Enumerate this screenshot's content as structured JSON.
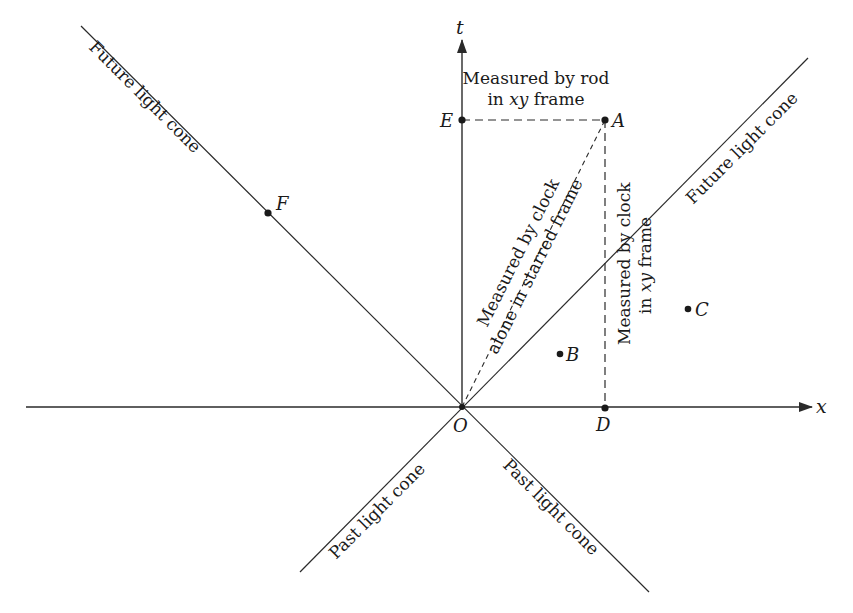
{
  "diagram": {
    "axes": {
      "x_label": "x",
      "t_label": "t",
      "origin_label": "O"
    },
    "light_cones": {
      "future_left": "Future light cone",
      "future_right": "Future light cone",
      "past_left": "Past light cone",
      "past_right": "Past light cone"
    },
    "points": {
      "A": "A",
      "B": "B",
      "C": "C",
      "D": "D",
      "E": "E",
      "F": "F"
    },
    "annotations": {
      "rod_line1": "Measured by rod",
      "rod_line2_pre": "in ",
      "rod_line2_it": "xy",
      "rod_line2_post": " frame",
      "starred_line1": "Measured by clock",
      "starred_line2": "alone in starred frame",
      "clock_xy_line1": "Measured by clock",
      "clock_xy_line2_pre": "in ",
      "clock_xy_line2_it": "xy",
      "clock_xy_line2_post": " frame"
    },
    "colors": {
      "ink": "#2a2a2a",
      "background": "#ffffff"
    }
  }
}
